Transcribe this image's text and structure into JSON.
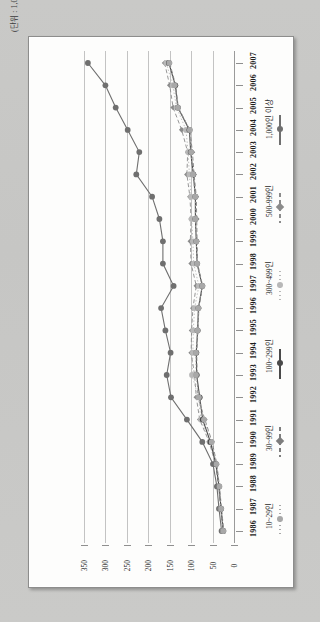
{
  "unit_caption": "(단위 : 1,000원/개)",
  "chart_data": {
    "type": "line",
    "orientation": "rotated-90",
    "title": "",
    "subtitle": "",
    "xlabel": "",
    "ylabel": "",
    "unit": "(단위 : 1,000원/개)",
    "grid": true,
    "legend_position": "right",
    "value_axis": {
      "ticks": [
        "350",
        "300",
        "250",
        "200",
        "150",
        "100",
        "50",
        "0"
      ],
      "min": 0,
      "max": 350,
      "direction": "descending-left-to-right"
    },
    "categories": [
      "2007",
      "2006",
      "2005",
      "2004",
      "2003",
      "2002",
      "2001",
      "2000",
      "1999",
      "1998",
      "1997",
      "1996",
      "1995",
      "1994",
      "1993",
      "1992",
      "1991",
      "1990",
      "1989",
      "1988",
      "1987",
      "1986"
    ],
    "series": [
      {
        "name": "1,000인 이상",
        "marker": "circle",
        "line": "solid",
        "color": "#6f6f6f",
        "values": [
          341,
          300,
          276,
          248,
          221,
          228,
          191,
          174,
          166,
          166,
          141,
          170,
          160,
          148,
          157,
          147,
          110,
          74,
          49,
          40,
          35,
          29
        ]
      },
      {
        "name": "500-999인",
        "marker": "diamond",
        "line": "dashed",
        "color": "#8b8b8b",
        "values": [
          162,
          150,
          142,
          122,
          108,
          110,
          103,
          100,
          102,
          100,
          88,
          96,
          99,
          100,
          92,
          88,
          80,
          58,
          43,
          36,
          31,
          26
        ]
      },
      {
        "name": "300~499인",
        "marker": "circle",
        "line": "dotted",
        "color": "#b8b8b8",
        "values": [
          158,
          143,
          134,
          112,
          107,
          104,
          100,
          99,
          96,
          94,
          82,
          92,
          95,
          96,
          98,
          83,
          77,
          57,
          42,
          35,
          31,
          26
        ]
      },
      {
        "name": "100~299인",
        "marker": "circle",
        "line": "solid",
        "color": "#4a4a4a",
        "values": [
          152,
          137,
          131,
          104,
          101,
          95,
          90,
          90,
          88,
          86,
          74,
          83,
          85,
          88,
          87,
          80,
          73,
          55,
          42,
          35,
          30,
          25
        ]
      },
      {
        "name": "30~99인",
        "marker": "diamond",
        "line": "dashed",
        "color": "#7d7d7d",
        "values": [
          150,
          136,
          130,
          103,
          97,
          93,
          88,
          87,
          86,
          85,
          73,
          82,
          84,
          87,
          86,
          84,
          68,
          51,
          40,
          34,
          29,
          24
        ]
      },
      {
        "name": "10~29인",
        "marker": "circle",
        "line": "dotted",
        "color": "#a8a8a8",
        "values": [
          151,
          139,
          131,
          103,
          100,
          96,
          90,
          90,
          88,
          86,
          74,
          83,
          85,
          89,
          89,
          82,
          70,
          52,
          41,
          34,
          30,
          25
        ]
      }
    ]
  },
  "legend": {
    "items": [
      {
        "label": "1,000인 이상"
      },
      {
        "label": "500-999인"
      },
      {
        "label": "300~499인"
      },
      {
        "label": "100~299인"
      },
      {
        "label": "30~99인"
      },
      {
        "label": "10~29인"
      }
    ]
  }
}
